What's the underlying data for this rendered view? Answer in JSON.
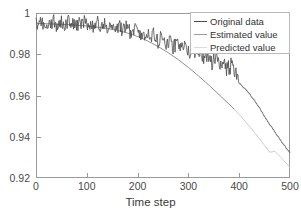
{
  "chart_data": {
    "type": "line",
    "title": "",
    "xlabel": "Time step",
    "ylabel": "",
    "xlim": [
      0,
      500
    ],
    "ylim": [
      0.92,
      1.0
    ],
    "xticks": [
      "0",
      "100",
      "200",
      "300",
      "400",
      "500"
    ],
    "xtick_values": [
      0,
      100,
      200,
      300,
      400,
      500
    ],
    "yticks": [
      "0.92",
      "0.94",
      "0.96",
      "0.98",
      "1"
    ],
    "ytick_values": [
      0.92,
      0.94,
      0.96,
      0.98,
      1.0
    ],
    "grid": false,
    "legend_position": "upper right",
    "series": [
      {
        "name": "Original data",
        "color": "#4d4d4d",
        "x": [
          0,
          5,
          10,
          15,
          20,
          25,
          30,
          35,
          40,
          45,
          50,
          55,
          60,
          65,
          70,
          75,
          80,
          85,
          90,
          95,
          100,
          105,
          110,
          115,
          120,
          125,
          130,
          135,
          140,
          145,
          150,
          155,
          160,
          165,
          170,
          175,
          180,
          185,
          190,
          195,
          200,
          205,
          210,
          215,
          220,
          225,
          230,
          235,
          240,
          245,
          250,
          255,
          260,
          265,
          270,
          275,
          280,
          285,
          290,
          295,
          300,
          305,
          310,
          315,
          320,
          325,
          330,
          335,
          340,
          345,
          350,
          355,
          360,
          365,
          370,
          375,
          380,
          385,
          390,
          395,
          400,
          405,
          410,
          415,
          420,
          425,
          430,
          435,
          440,
          445,
          450,
          455,
          460,
          465,
          470,
          475,
          480,
          485,
          490,
          495,
          500
        ],
        "values": [
          0.9952,
          0.9938,
          0.9961,
          0.9944,
          0.993,
          0.9957,
          0.9941,
          0.9968,
          0.9935,
          0.995,
          0.9962,
          0.9933,
          0.9947,
          0.9971,
          0.994,
          0.9955,
          0.9929,
          0.9958,
          0.9943,
          0.9966,
          0.9936,
          0.9951,
          0.9925,
          0.9948,
          0.996,
          0.9931,
          0.9945,
          0.9953,
          0.9922,
          0.994,
          0.9928,
          0.9946,
          0.9918,
          0.9935,
          0.9908,
          0.9926,
          0.994,
          0.9902,
          0.992,
          0.9933,
          0.9895,
          0.9912,
          0.9878,
          0.9898,
          0.9915,
          0.987,
          0.9888,
          0.9902,
          0.9858,
          0.9875,
          0.9888,
          0.9845,
          0.9862,
          0.9874,
          0.9832,
          0.9848,
          0.9861,
          0.9818,
          0.9835,
          0.9846,
          0.9802,
          0.982,
          0.9832,
          0.9788,
          0.9805,
          0.9816,
          0.9772,
          0.979,
          0.98,
          0.9756,
          0.9772,
          0.9784,
          0.974,
          0.9755,
          0.9766,
          0.9722,
          0.9738,
          0.9748,
          0.9704,
          0.9718,
          0.966,
          0.9648,
          0.9636,
          0.9622,
          0.9608,
          0.9592,
          0.9576,
          0.9558,
          0.954,
          0.952,
          0.9498,
          0.9478,
          0.946,
          0.9442,
          0.9424,
          0.9406,
          0.9388,
          0.937,
          0.9354,
          0.9338,
          0.9322
        ]
      },
      {
        "name": "Estimated value",
        "color": "#8f8f8f",
        "x": [
          0,
          20,
          40,
          60,
          80,
          100,
          120,
          140,
          160,
          180,
          200,
          220,
          240,
          260,
          280,
          300,
          320,
          340,
          360,
          380,
          390
        ],
        "values": [
          0.995,
          0.9948,
          0.9946,
          0.9944,
          0.9941,
          0.9937,
          0.9932,
          0.9925,
          0.9916,
          0.9903,
          0.9886,
          0.9864,
          0.9838,
          0.9808,
          0.9774,
          0.9736,
          0.9695,
          0.9651,
          0.9605,
          0.9558,
          0.9534
        ]
      },
      {
        "name": "Predicted value",
        "color": "#c8c8c8",
        "x": [
          390,
          400,
          410,
          420,
          430,
          440,
          450,
          460,
          470,
          480,
          490,
          500
        ],
        "values": [
          0.9534,
          0.9508,
          0.948,
          0.9451,
          0.9421,
          0.939,
          0.9358,
          0.9325,
          0.933,
          0.9305,
          0.9278,
          0.925
        ]
      }
    ]
  },
  "legend": {
    "items": [
      {
        "label": "Original data",
        "color": "#4d4d4d"
      },
      {
        "label": "Estimated value",
        "color": "#9b9b9b"
      },
      {
        "label": "Predicted value",
        "color": "#d2d2d2"
      }
    ]
  },
  "axis": {
    "x_title": "Time step"
  }
}
